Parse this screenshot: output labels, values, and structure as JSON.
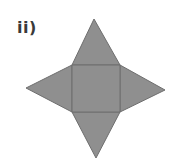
{
  "label": "ii)",
  "figure": {
    "fill_color": "#8f8f8f",
    "stroke_color": "#6e6e6e",
    "square": {
      "x1": 72,
      "y1": 65,
      "x2": 120,
      "y2": 112
    },
    "apexes": {
      "top": [
        94,
        19
      ],
      "left": [
        26,
        88
      ],
      "right": [
        165,
        90
      ],
      "bottom": [
        96,
        158
      ]
    }
  }
}
